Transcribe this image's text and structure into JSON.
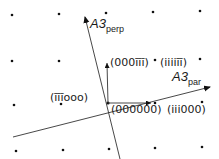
{
  "diagram": {
    "colors": {
      "line": "#333333",
      "dot": "#111111",
      "text": "#1a1a1a",
      "background": "#ffffff"
    },
    "axes": {
      "par": {
        "base": "A3",
        "sub": "par"
      },
      "perp": {
        "base": "A3",
        "sub": "perp"
      }
    },
    "points": {
      "origin": "(000000)",
      "p1": "(111000)",
      "p2": "(000111)",
      "p3": "(111111)",
      "p4": "(111000)"
    },
    "point_labels_display": {
      "origin": "(000000)",
      "right": "(111000)",
      "up": "(000111)",
      "up_right": "(111111)",
      "left": "(111000)"
    }
  },
  "labels": {
    "up": "(000īīī)",
    "up_right": "(iiiiīī)",
    "left": "(īīīooo)",
    "origin": "(000000)",
    "right": "(iii000)",
    "perp_base": "A3",
    "perp_sub": "perp",
    "par_base": "A3",
    "par_sub": "par"
  }
}
